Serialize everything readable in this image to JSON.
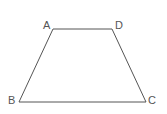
{
  "diagram": {
    "type": "geometry-figure",
    "shape": "trapezoid",
    "stroke_color": "#555555",
    "background": "#ffffff",
    "vertices": [
      {
        "label": "A",
        "x": 53,
        "y": 29,
        "label_x": 43,
        "label_y": 29
      },
      {
        "label": "D",
        "x": 112,
        "y": 29,
        "label_x": 115,
        "label_y": 29
      },
      {
        "label": "C",
        "x": 146,
        "y": 102,
        "label_x": 148,
        "label_y": 104
      },
      {
        "label": "B",
        "x": 19,
        "y": 102,
        "label_x": 8,
        "label_y": 104
      }
    ],
    "edges": [
      [
        "A",
        "D"
      ],
      [
        "D",
        "C"
      ],
      [
        "C",
        "B"
      ],
      [
        "B",
        "A"
      ]
    ]
  }
}
